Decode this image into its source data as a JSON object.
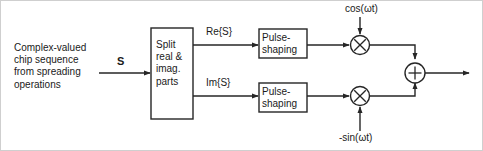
{
  "diagram": {
    "stroke_color": "#262626",
    "text_color": "#1a1a1a",
    "background_color": "#ffffff",
    "source_block": {
      "lines": [
        "Complex-valued",
        "chip sequence",
        "from spreading",
        "operations"
      ]
    },
    "signals": {
      "input_label": "S",
      "real_branch_label": "Re{S}",
      "imag_branch_label": "Im{S}"
    },
    "blocks": [
      {
        "name": "split-block",
        "lines": [
          "Split",
          "real &",
          "imag.",
          "parts"
        ]
      },
      {
        "name": "pulse-shaping-upper",
        "lines": [
          "Pulse-",
          "shaping"
        ]
      },
      {
        "name": "pulse-shaping-lower",
        "lines": [
          "Pulse-",
          "shaping"
        ]
      }
    ],
    "carriers": {
      "upper": "cos(ωt)",
      "lower": "-sin(ωt)"
    },
    "operators": {
      "multiply_symbol": "×",
      "sum_symbol": "+"
    }
  }
}
